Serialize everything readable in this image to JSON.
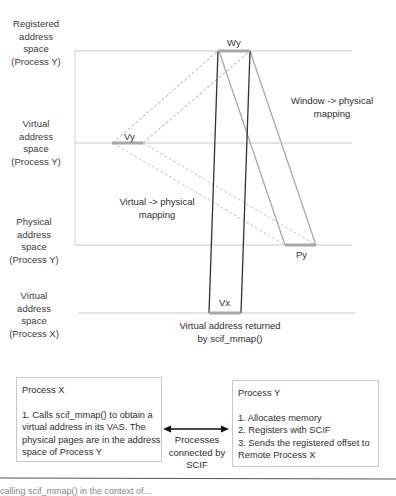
{
  "diagram": {
    "row_labels": {
      "registered": [
        "Registered",
        "address",
        "space",
        "(Process Y)"
      ],
      "virtual_y": [
        "Virtual",
        "address",
        "space",
        "(Process Y)"
      ],
      "physical_y": [
        "Physical",
        "address",
        "space",
        "(Process Y)"
      ],
      "virtual_x": [
        "Virtual",
        "address",
        "space",
        "(Process X)"
      ]
    },
    "regions": {
      "wy": "Wy",
      "vy": "Vy",
      "py": "Py",
      "vx": "Vx"
    },
    "annotations": {
      "window_mapping": [
        "Window -> physical",
        "mapping"
      ],
      "virtual_mapping": [
        "Virtual -> physical",
        "mapping"
      ],
      "returned": [
        "Virtual address returned",
        "by scif_mmap()"
      ]
    },
    "colors": {
      "axis_line": "#c9c9c9",
      "region_bar": "#a8a8a8",
      "dark_line": "#333333",
      "gray_line": "#a9a9a9",
      "dashed_line": "#a0a0a0"
    }
  },
  "process_x_box": {
    "title": "Process X",
    "lines": [
      "1. Calls scif_mmap() to obtain a",
      "virtual address in its VAS. The",
      "physical pages are in the address",
      "space of Process Y"
    ]
  },
  "connector": {
    "label": [
      "Processes",
      "connected by",
      "SCIF"
    ]
  },
  "process_y_box": {
    "title": "Process Y",
    "lines": [
      "1. Allocates memory",
      "2. Registers with SCIF",
      "3. Sends the registered offset to",
      "Remote Process X"
    ]
  },
  "footer": {
    "text": "calling scif_mmap() in the context of..."
  }
}
